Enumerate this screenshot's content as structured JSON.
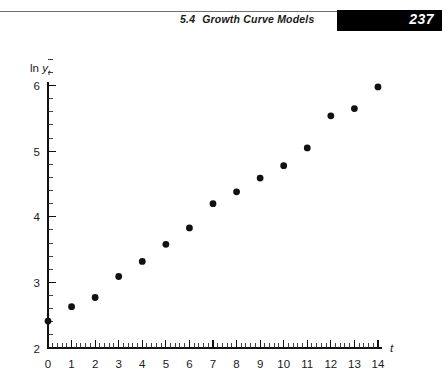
{
  "header": {
    "section_number": "5.4",
    "section_title": "Growth Curve Models",
    "page_number": "237"
  },
  "chart_data": {
    "type": "scatter",
    "title": "",
    "xlabel": "t",
    "ylabel": "ln y",
    "ylabel_roman": "ln",
    "ylabel_italic": "y",
    "ylabel_subscript": "t",
    "xlim": [
      0,
      14.6
    ],
    "ylim": [
      2,
      6.3
    ],
    "grid": false,
    "legend": "none",
    "x_ticks": [
      "0",
      "1",
      "2",
      "3",
      "4",
      "5",
      "6",
      "7",
      "8",
      "9",
      "10",
      "11",
      "12",
      "13",
      "14"
    ],
    "y_ticks": [
      "2",
      "3",
      "4",
      "5",
      "6"
    ],
    "x_minor_per_unit": 5,
    "y_minor_per_unit": 5,
    "x": [
      0,
      1,
      2,
      3,
      4,
      5,
      6,
      7,
      8,
      9,
      10,
      11,
      12,
      13,
      14
    ],
    "y": [
      2.41,
      2.63,
      2.77,
      3.09,
      3.32,
      3.58,
      3.83,
      4.2,
      4.38,
      4.59,
      4.78,
      5.05,
      5.54,
      5.65,
      5.98
    ],
    "marker": "filled-circle",
    "marker_color": "#111111"
  }
}
